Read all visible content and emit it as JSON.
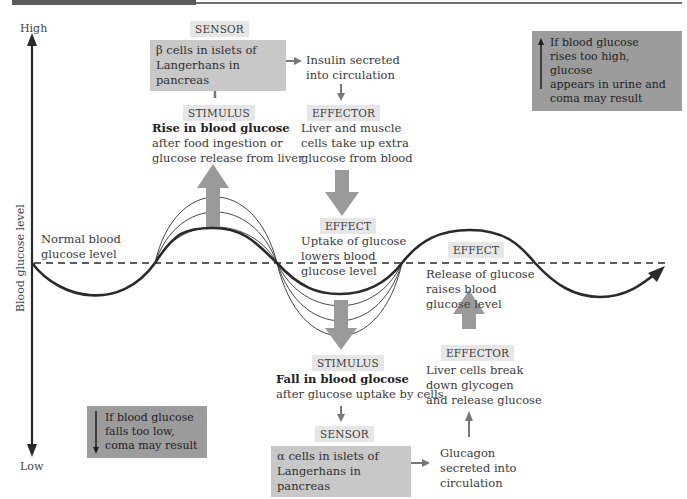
{
  "axis": {
    "high_label": "High",
    "low_label": "Low",
    "y_title": "Blood glucose level"
  },
  "normal_level": {
    "label_line1": "Normal blood",
    "label_line2": "glucose level"
  },
  "high_path": {
    "sensor_tag": "SENSOR",
    "sensor_line1": "β cells in islets of",
    "sensor_line2": "Langerhans in pancreas",
    "secretion_line1": "Insulin secreted",
    "secretion_line2": "into circulation",
    "stimulus_tag": "STIMULUS",
    "stimulus_title": "Rise in blood glucose",
    "stimulus_line1": "after food ingestion or",
    "stimulus_line2": "glucose release from liver",
    "effector_tag": "EFFECTOR",
    "effector_line1": "Liver and muscle",
    "effector_line2": "cells take up extra",
    "effector_line3": "glucose from blood",
    "effect_tag": "EFFECT",
    "effect_line1": "Uptake of glucose",
    "effect_line2": "lowers blood",
    "effect_line3": "glucose level"
  },
  "low_path": {
    "stimulus_tag": "STIMULUS",
    "stimulus_title": "Fall in blood glocose",
    "stimulus_line1": "after glucose uptake by cells",
    "sensor_tag": "SENSOR",
    "sensor_line1": "α cells in islets of",
    "sensor_line2": "Langerhans in pancreas",
    "secretion_line1": "Glucagon",
    "secretion_line2": "secreted into",
    "secretion_line3": "circulation",
    "effector_tag": "EFFECTOR",
    "effector_line1": "Liver cells break",
    "effector_line2": "down glycogen",
    "effector_line3": "and release glucose",
    "effect_tag": "EFFECT",
    "effect_line1": "Release of glucose",
    "effect_line2": "raises blood",
    "effect_line3": "glucose level"
  },
  "warnings": {
    "high_line1": "If blood glucose",
    "high_line2": "rises too high, glucose",
    "high_line3": "appears in urine and",
    "high_line4": "coma may result",
    "low_line1": "If blood glucose",
    "low_line2": "falls too low,",
    "low_line3": "coma may result"
  },
  "colors": {
    "curve": "#2a2a2a",
    "block_arrow": "#9a9a9a",
    "sensor_box": "#c8c8c8",
    "warning_box": "#9c9c9c",
    "tag_bg": "#e6e6e6"
  }
}
